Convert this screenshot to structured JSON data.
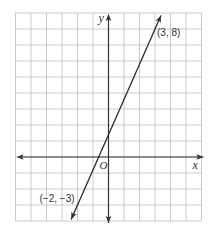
{
  "chart_data": {
    "type": "line",
    "title": "",
    "xlabel": "x",
    "ylabel": "y",
    "origin_label": "O",
    "xlim": [
      -6,
      6
    ],
    "ylim": [
      -4,
      9
    ],
    "grid": true,
    "legend": null,
    "series": [
      {
        "name": "line through (-2, -3) and (3, 8)",
        "points": [
          {
            "x": -2,
            "y": -3,
            "label": "(−2, −3)"
          },
          {
            "x": 3,
            "y": 8,
            "label": "(3, 8)"
          }
        ],
        "slope": 2.2,
        "y_intercept": 1.4,
        "arrows": "both"
      }
    ],
    "annotations": [
      "(3, 8)",
      "(−2, −3)"
    ]
  },
  "colors": {
    "grid": "#bdbdbd",
    "axis": "#333333",
    "line": "#2a2a2a"
  }
}
